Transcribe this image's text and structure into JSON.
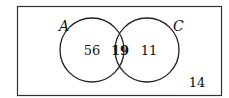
{
  "diagram": {
    "type": "venn",
    "sets": [
      {
        "label": "A",
        "only": "56"
      },
      {
        "label": "C",
        "only": "11"
      }
    ],
    "intersection": "19",
    "outside": "14",
    "colors": {
      "stroke": "#222222",
      "background": "#ffffff"
    }
  }
}
